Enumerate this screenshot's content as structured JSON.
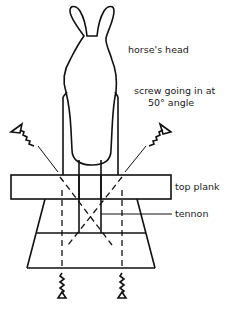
{
  "diagram": {
    "labels": {
      "horses_head": "horse's head",
      "screw_line1": "screw going in at",
      "screw_line2": "50° angle",
      "top_plank": "top plank",
      "tennon": "tennon"
    },
    "components": [
      {
        "id": "horses-head",
        "label": "horse's head"
      },
      {
        "id": "angled-screw-left",
        "label": "screw going in at 50° angle"
      },
      {
        "id": "angled-screw-right",
        "label": "screw going in at 50° angle"
      },
      {
        "id": "top-plank",
        "label": "top plank"
      },
      {
        "id": "tennon",
        "label": "tennon"
      },
      {
        "id": "base-block",
        "label": ""
      },
      {
        "id": "bottom-screw-left",
        "label": ""
      },
      {
        "id": "bottom-screw-right",
        "label": ""
      }
    ],
    "screw_angle_degrees": 50,
    "line_color": "#111111",
    "background_color": "#ffffff"
  }
}
